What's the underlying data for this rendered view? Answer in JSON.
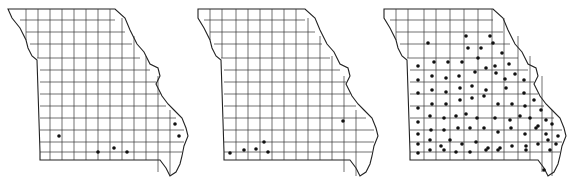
{
  "figure": {
    "type": "county distribution maps",
    "region": "Missouri",
    "panels": [
      {
        "id": "map-1",
        "dots": [
          [
            59,
            136
          ],
          [
            98,
            152
          ],
          [
            114,
            148
          ],
          [
            127,
            152
          ],
          [
            175,
            124
          ],
          [
            179,
            136
          ]
        ]
      },
      {
        "id": "map-2",
        "dots": [
          [
            40,
            153
          ],
          [
            54,
            150
          ],
          [
            66,
            149
          ],
          [
            74,
            142
          ],
          [
            78,
            152
          ],
          [
            153,
            121
          ]
        ]
      },
      {
        "id": "map-3",
        "dots": [
          [
            86,
            36
          ],
          [
            110,
            36
          ],
          [
            48,
            43
          ],
          [
            88,
            48
          ],
          [
            101,
            48
          ],
          [
            113,
            43
          ],
          [
            122,
            53
          ],
          [
            38,
            66
          ],
          [
            54,
            62
          ],
          [
            68,
            62
          ],
          [
            82,
            62
          ],
          [
            98,
            58
          ],
          [
            115,
            66
          ],
          [
            129,
            64
          ],
          [
            38,
            80
          ],
          [
            52,
            76
          ],
          [
            66,
            78
          ],
          [
            79,
            76
          ],
          [
            95,
            72
          ],
          [
            106,
            68
          ],
          [
            116,
            73
          ],
          [
            125,
            79
          ],
          [
            135,
            74
          ],
          [
            144,
            80
          ],
          [
            38,
            93
          ],
          [
            52,
            90
          ],
          [
            66,
            92
          ],
          [
            80,
            88
          ],
          [
            92,
            86
          ],
          [
            106,
            90
          ],
          [
            126,
            88
          ],
          [
            144,
            93
          ],
          [
            38,
            108
          ],
          [
            52,
            104
          ],
          [
            66,
            104
          ],
          [
            80,
            100
          ],
          [
            92,
            98
          ],
          [
            104,
            96
          ],
          [
            118,
            104
          ],
          [
            132,
            104
          ],
          [
            145,
            106
          ],
          [
            154,
            100
          ],
          [
            161,
            110
          ],
          [
            38,
            122
          ],
          [
            50,
            116
          ],
          [
            64,
            118
          ],
          [
            76,
            116
          ],
          [
            86,
            114
          ],
          [
            97,
            118
          ],
          [
            115,
            118
          ],
          [
            130,
            120
          ],
          [
            140,
            116
          ],
          [
            150,
            118
          ],
          [
            158,
            126
          ],
          [
            166,
            120
          ],
          [
            38,
            134
          ],
          [
            51,
            130
          ],
          [
            64,
            130
          ],
          [
            78,
            128
          ],
          [
            90,
            128
          ],
          [
            104,
            128
          ],
          [
            118,
            132
          ],
          [
            131,
            128
          ],
          [
            145,
            134
          ],
          [
            156,
            128
          ],
          [
            166,
            134
          ],
          [
            172,
            124
          ],
          [
            38,
            144
          ],
          [
            50,
            140
          ],
          [
            61,
            146
          ],
          [
            70,
            140
          ],
          [
            82,
            144
          ],
          [
            96,
            142
          ],
          [
            108,
            148
          ],
          [
            120,
            148
          ],
          [
            132,
            146
          ],
          [
            146,
            146
          ],
          [
            158,
            144
          ],
          [
            168,
            140
          ],
          [
            176,
            144
          ],
          [
            38,
            153
          ],
          [
            50,
            150
          ],
          [
            64,
            150
          ],
          [
            76,
            152
          ],
          [
            90,
            152
          ],
          [
            106,
            150
          ],
          [
            118,
            150
          ],
          [
            146,
            150
          ],
          [
            170,
            150
          ],
          [
            178,
            136
          ],
          [
            164,
            170
          ]
        ]
      }
    ]
  }
}
